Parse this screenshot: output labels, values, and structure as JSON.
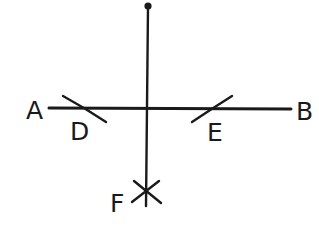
{
  "diagram": {
    "type": "geometric-construction",
    "colors": {
      "ink": "#1a1a1a",
      "background": "#ffffff"
    },
    "labels": {
      "A": "A",
      "B": "B",
      "D": "D",
      "E": "E",
      "F": "F"
    },
    "elements": {
      "line_AB": {
        "from": "A",
        "to": "B"
      },
      "perpendicular": {
        "from": "top-point",
        "to": "F"
      },
      "arc_D": {
        "on": "line_AB",
        "near": "A"
      },
      "arc_E": {
        "on": "line_AB",
        "near": "B"
      },
      "arcs_F": {
        "intersection": "F"
      }
    }
  }
}
